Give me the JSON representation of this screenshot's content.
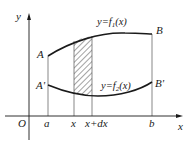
{
  "diagram": {
    "title": "",
    "axes": {
      "x_label": "x",
      "y_label": "y",
      "origin_label": "O"
    },
    "x_ticks": [
      {
        "label": "a",
        "x": 48
      },
      {
        "label": "x",
        "x": 74
      },
      {
        "label": "x+dx",
        "x": 92
      },
      {
        "label": "b",
        "x": 152
      }
    ],
    "curves": [
      {
        "name": "upper",
        "equation_prefix": "y=f",
        "subscript": "1",
        "equation_suffix": "(x)",
        "start_point": "A",
        "end_point": "B"
      },
      {
        "name": "lower",
        "equation_prefix": "y=f",
        "subscript": "2",
        "equation_suffix": "(x)",
        "start_point": "A'",
        "end_point": "B'"
      }
    ],
    "points": {
      "A": "A",
      "B": "B",
      "A_prime": "A'",
      "B_prime": "B'"
    },
    "shaded_strip": {
      "from": "x",
      "to": "x+dx",
      "pattern": "diagonal-hatch"
    },
    "colors": {
      "stroke": "#1a1a1a",
      "thin_stroke": "#555555",
      "background": "#ffffff"
    }
  }
}
